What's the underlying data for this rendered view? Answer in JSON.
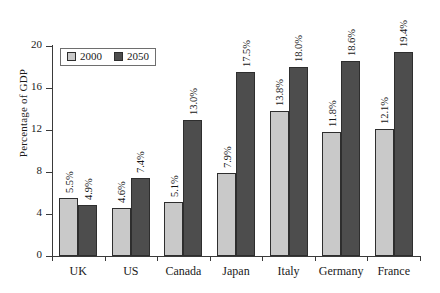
{
  "chart_data": {
    "type": "bar",
    "title": "",
    "xlabel": "",
    "ylabel": "Percentage of GDP",
    "ylim": [
      0,
      20
    ],
    "yticks": [
      0,
      4,
      8,
      12,
      16,
      20
    ],
    "ytick_labels": [
      "0",
      "4",
      "8",
      "12",
      "16",
      "20"
    ],
    "grid": false,
    "legend_position": "top-left",
    "categories": [
      "UK",
      "US",
      "Canada",
      "Japan",
      "Italy",
      "Germany",
      "France"
    ],
    "series": [
      {
        "name": "2000",
        "color": "#c9c9c9",
        "values": [
          5.5,
          4.6,
          5.1,
          7.9,
          13.8,
          11.8,
          12.1
        ],
        "labels": [
          "5.5%",
          "4.6%",
          "5.1%",
          "7.9%",
          "13.8%",
          "11.8%",
          "12.1%"
        ]
      },
      {
        "name": "2050",
        "color": "#4d4d4d",
        "values": [
          4.9,
          7.4,
          13.0,
          17.5,
          18.0,
          18.6,
          19.4
        ],
        "labels": [
          "4.9%",
          "7.4%",
          "13.0%",
          "17.5%",
          "18.0%",
          "18.6%",
          "19.4%"
        ]
      }
    ]
  },
  "legend": {
    "entries": [
      {
        "label": "2000"
      },
      {
        "label": "2050"
      }
    ]
  }
}
